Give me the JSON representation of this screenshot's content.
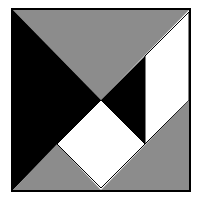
{
  "diagram": {
    "type": "tangram-square",
    "colors": {
      "black": "#000000",
      "gray": "#8c8c8c",
      "white": "#ffffff",
      "border": "#000000"
    },
    "pieces": [
      {
        "name": "top-gray-large-triangle",
        "fill": "gray",
        "points": "13,10 189,10 101,100"
      },
      {
        "name": "left-black-large-triangle",
        "fill": "black",
        "points": "13,10 101,100 13,190"
      },
      {
        "name": "right-black-small-triangle",
        "fill": "black",
        "points": "101,100 145,56 145,144"
      },
      {
        "name": "white-parallelogram",
        "fill": "white",
        "points": "145,56 189,12 189,100 145,144"
      },
      {
        "name": "white-square",
        "fill": "white",
        "points": "101,100 145,144 101,188 57,144"
      },
      {
        "name": "bottom-left-gray-triangle",
        "fill": "gray",
        "points": "13,190 57,144 101,188"
      },
      {
        "name": "bottom-right-gray-triangle",
        "fill": "gray",
        "points": "101,190 189,100 189,190"
      }
    ]
  }
}
